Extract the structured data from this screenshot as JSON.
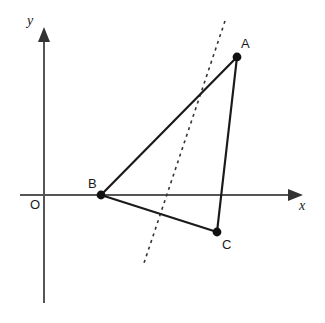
{
  "figure": {
    "background_color": "#ffffff",
    "width": 325,
    "height": 323
  },
  "axes": {
    "x_axis": {
      "label": "x",
      "label_style": "italic",
      "color": "#555555",
      "start_x": 20,
      "end_x": 303,
      "y": 195,
      "arrow": "right"
    },
    "y_axis": {
      "label": "y",
      "label_style": "italic",
      "color": "#555555",
      "x": 44,
      "start_y": 303,
      "end_y": 27,
      "arrow": "up"
    },
    "origin": {
      "label": "O",
      "x": 44,
      "y": 195
    }
  },
  "triangle": {
    "name": "ABC",
    "stroke_color": "#1a1a1a",
    "vertices": [
      {
        "label": "A",
        "x": 237,
        "y": 57,
        "label_x": 241,
        "label_y": 37
      },
      {
        "label": "B",
        "x": 101,
        "y": 195,
        "label_x": 88,
        "label_y": 177
      },
      {
        "label": "C",
        "x": 217,
        "y": 232,
        "label_x": 222,
        "label_y": 238
      }
    ],
    "sides": [
      {
        "name": "AB",
        "from": "A",
        "to": "B"
      },
      {
        "name": "BC",
        "from": "B",
        "to": "C"
      },
      {
        "name": "CA",
        "from": "C",
        "to": "A"
      }
    ]
  },
  "dashed_line": {
    "name": "dashed-construction-line",
    "color": "#333333",
    "x1": 225,
    "y1": 21,
    "x2": 144,
    "y2": 263
  }
}
